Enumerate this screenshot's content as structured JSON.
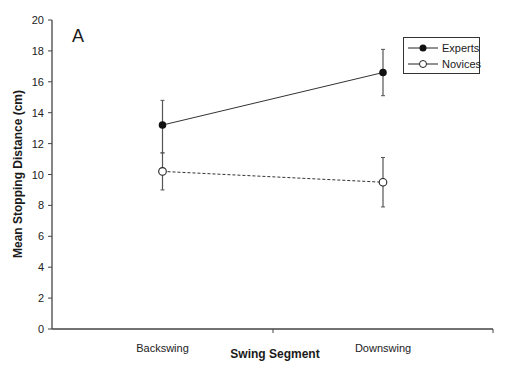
{
  "chart_data": {
    "type": "line",
    "panel_label": "A",
    "title": "",
    "xlabel": "Swing Segment",
    "ylabel": "Mean Stopping Distance (cm)",
    "categories": [
      "Backswing",
      "Downswing"
    ],
    "ylim": [
      0,
      20
    ],
    "yticks": [
      0,
      2,
      4,
      6,
      8,
      10,
      12,
      14,
      16,
      18,
      20
    ],
    "grid": false,
    "legend_position": "upper right",
    "series": [
      {
        "name": "Experts",
        "marker": "filled-circle",
        "line": "solid",
        "values": [
          13.2,
          16.6
        ],
        "error_low": [
          11.4,
          15.1
        ],
        "error_high": [
          14.8,
          18.1
        ]
      },
      {
        "name": "Novices",
        "marker": "open-circle",
        "line": "dashed",
        "values": [
          10.2,
          9.5
        ],
        "error_low": [
          9.0,
          7.9
        ],
        "error_high": [
          11.4,
          11.1
        ]
      }
    ]
  },
  "labels": {
    "panel": "A",
    "xlabel": "Swing Segment",
    "ylabel": "Mean Stopping Distance (cm)",
    "cat0": "Backswing",
    "cat1": "Downswing",
    "legend0": "Experts",
    "legend1": "Novices"
  }
}
